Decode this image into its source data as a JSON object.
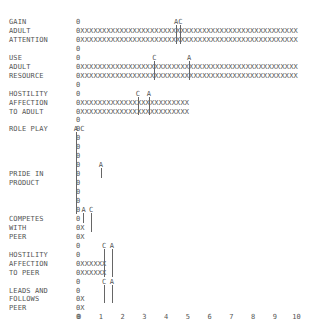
{
  "chart_data": {
    "type": "bar",
    "style": "ascii line-printer horizontal bar chart",
    "title": "",
    "xlabel": "",
    "ylabel": "",
    "xlim": [
      0,
      10
    ],
    "x_ticks": [
      "0",
      "1",
      "2",
      "3",
      "4",
      "5",
      "6",
      "7",
      "8",
      "9",
      "10"
    ],
    "bar_char": "X",
    "origin_char": "0",
    "categories": [
      "GAIN ADULT ATTENTION",
      "USE ADULT RESOURCE",
      "HOSTILITY AFFECTION TO ADULT",
      "ROLE PLAY",
      "PRIDE IN PRODUCT",
      "COMPETES WITH PEER",
      "HOSTILITY AFFECTION TO PEER",
      "LEADS AND FOLLOWS PEER"
    ],
    "values": [
      10.0,
      10.0,
      5.1,
      0.0,
      0.0,
      0.2,
      1.2,
      0.2
    ],
    "markers": [
      {
        "category": "GAIN ADULT ATTENTION",
        "A": 4.5,
        "C": 4.7
      },
      {
        "category": "USE ADULT RESOURCE",
        "C": 3.5,
        "A": 5.1
      },
      {
        "category": "HOSTILITY AFFECTION TO ADULT",
        "C": 2.8,
        "A": 3.3
      },
      {
        "category": "ROLE PLAY",
        "A": 0.0,
        "C": 0.1
      },
      {
        "category": "PRIDE IN PRODUCT",
        "A": 1.0
      },
      {
        "category": "COMPETES WITH PEER",
        "A": 0.2,
        "C": 0.6
      },
      {
        "category": "HOSTILITY AFFECTION TO PEER",
        "C": 1.2,
        "A": 1.5
      },
      {
        "category": "LEADS AND FOLLOWS PEER",
        "C": 1.2,
        "A": 1.5
      }
    ],
    "legend": []
  },
  "labels": [
    {
      "row": 0,
      "text": "GAIN"
    },
    {
      "row": 1,
      "text": "ADULT"
    },
    {
      "row": 2,
      "text": "ATTENTION"
    },
    {
      "row": 4,
      "text": "USE"
    },
    {
      "row": 5,
      "text": "ADULT"
    },
    {
      "row": 6,
      "text": "RESOURCE"
    },
    {
      "row": 8,
      "text": "HOSTILITY"
    },
    {
      "row": 9,
      "text": "AFFECTION"
    },
    {
      "row": 10,
      "text": "TO ADULT"
    },
    {
      "row": 12,
      "text": "ROLE PLAY"
    },
    {
      "row": 17,
      "text": "PRIDE IN"
    },
    {
      "row": 18,
      "text": "PRODUCT"
    },
    {
      "row": 22,
      "text": "COMPETES"
    },
    {
      "row": 23,
      "text": "WITH"
    },
    {
      "row": 24,
      "text": "PEER"
    },
    {
      "row": 26,
      "text": "HOSTILITY"
    },
    {
      "row": 27,
      "text": "AFFECTION"
    },
    {
      "row": 28,
      "text": "TO PEER"
    },
    {
      "row": 30,
      "text": "LEADS AND"
    },
    {
      "row": 31,
      "text": "FOLLOWS"
    },
    {
      "row": 32,
      "text": "PEER"
    }
  ],
  "rows": [
    "0",
    "0XXXXXXXXXXXXXXXXXXXXXXXXXXXXXXXXXXXXXXXXXXXXXXXXXX",
    "0XXXXXXXXXXXXXXXXXXXXXXXXXXXXXXXXXXXXXXXXXXXXXXXXXX",
    "0",
    "0",
    "0XXXXXXXXXXXXXXXXXXXXXXXXXXXXXXXXXXXXXXXXXXXXXXXXXX",
    "0XXXXXXXXXXXXXXXXXXXXXXXXXXXXXXXXXXXXXXXXXXXXXXXXXX",
    "0",
    "0",
    "0XXXXXXXXXXXXXXXXXXXXXXXXX",
    "0XXXXXXXXXXXXXXXXXXXXXXXXX",
    "0",
    "0",
    "0",
    "0",
    "0",
    "0",
    "0",
    "0",
    "0",
    "0",
    "0",
    "0",
    "0X",
    "0X",
    "0",
    "0",
    "0XXXXXX",
    "0XXXXXX",
    "0",
    "0",
    "0X",
    "0X",
    "0"
  ],
  "markers_drawn": [
    {
      "row": 0,
      "text": "A",
      "x": 4.5,
      "span": [
        1,
        2
      ]
    },
    {
      "row": 0,
      "text": "C",
      "x": 4.7,
      "span": [
        1,
        2
      ]
    },
    {
      "row": 4,
      "text": "C",
      "x": 3.5,
      "span": [
        5,
        6
      ]
    },
    {
      "row": 4,
      "text": "A",
      "x": 5.1,
      "span": [
        5,
        6
      ]
    },
    {
      "row": 8,
      "text": "C",
      "x": 2.75,
      "span": [
        9,
        10
      ]
    },
    {
      "row": 8,
      "text": "A",
      "x": 3.25,
      "span": [
        9,
        10
      ]
    },
    {
      "row": 12,
      "text": "A",
      "x": -0.1,
      "span": [
        12,
        21
      ]
    },
    {
      "row": 12,
      "text": "C",
      "x": 0.2,
      "span": []
    },
    {
      "row": 16,
      "text": "A",
      "x": 1.05,
      "span": [
        17,
        17
      ]
    },
    {
      "row": 21,
      "text": "A",
      "x": 0.25,
      "span": [
        22,
        22
      ]
    },
    {
      "row": 21,
      "text": "C",
      "x": 0.6,
      "span": [
        22,
        23
      ]
    },
    {
      "row": 25,
      "text": "C",
      "x": 1.2,
      "span": [
        26,
        28
      ]
    },
    {
      "row": 25,
      "text": "A",
      "x": 1.55,
      "span": [
        26,
        28
      ]
    },
    {
      "row": 29,
      "text": "C",
      "x": 1.2,
      "span": [
        30,
        31
      ]
    },
    {
      "row": 29,
      "text": "A",
      "x": 1.55,
      "span": [
        30,
        31
      ]
    }
  ],
  "colors": {
    "text": "#555555",
    "background": "#ffffff"
  }
}
